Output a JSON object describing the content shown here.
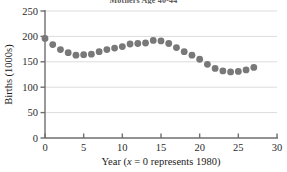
{
  "chart_data": {
    "type": "scatter",
    "title": "Mothers Age 40-44",
    "xlabel": "Year (x = 0 represents 1980)",
    "ylabel": "Births (1000s)",
    "xlim": [
      0,
      30
    ],
    "ylim": [
      0,
      250
    ],
    "xticks": [
      0,
      5,
      10,
      15,
      20,
      25,
      30
    ],
    "yticks": [
      0,
      50,
      100,
      150,
      200,
      250
    ],
    "grid": true,
    "legend": "none",
    "marker_color": "#787878",
    "axis_color": "#6e6e6e",
    "grid_color": "#dcdcdc",
    "x": [
      0,
      1,
      2,
      3,
      4,
      5,
      6,
      7,
      8,
      9,
      10,
      11,
      12,
      13,
      14,
      15,
      16,
      17,
      18,
      19,
      20,
      21,
      22,
      23,
      24,
      25,
      26,
      27
    ],
    "values": [
      196,
      184,
      174,
      168,
      163,
      164,
      165,
      170,
      174,
      177,
      180,
      185,
      186,
      187,
      192,
      191,
      186,
      178,
      170,
      163,
      155,
      145,
      137,
      132,
      130,
      131,
      134,
      139
    ],
    "xtick_labels": [
      "0",
      "5",
      "10",
      "15",
      "20",
      "25",
      "30"
    ],
    "ytick_labels": [
      "0",
      "50",
      "100",
      "150",
      "200",
      "250"
    ],
    "xlabel_parts": {
      "prefix": "Year (",
      "variable": "x",
      "suffix": " = 0 represents 1980)"
    }
  }
}
